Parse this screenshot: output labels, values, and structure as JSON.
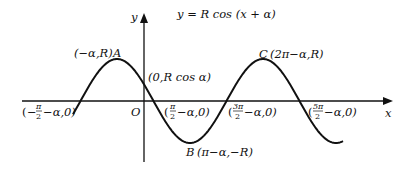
{
  "diagram": {
    "equation": "y = R cos (x + α)",
    "axes": {
      "x_label": "x",
      "y_label": "y",
      "origin_label": "O"
    },
    "points": {
      "A": {
        "name": "A",
        "coords": "(−α,R)"
      },
      "B": {
        "name": "B",
        "coords": "(π−α,−R)"
      },
      "C": {
        "name": "C",
        "coords": "(2π−α,R)"
      },
      "y_intercept": {
        "coords": "(0,R cos α)"
      }
    },
    "x_intercepts": [
      {
        "num": "π",
        "den": "2",
        "sign": "−",
        "suffix": "−α,0)"
      },
      {
        "num": "π",
        "den": "2",
        "sign": "",
        "suffix": "−α,0)"
      },
      {
        "num": "3π",
        "den": "2",
        "sign": "",
        "suffix": "−α,0)"
      },
      {
        "num": "5π",
        "den": "2",
        "sign": "",
        "suffix": "−α,0)"
      }
    ]
  }
}
